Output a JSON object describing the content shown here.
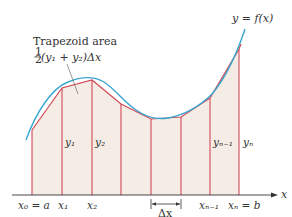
{
  "diagram": {
    "colors": {
      "curve": "#3aa6d0",
      "trapezoid_edges": "#d04a55",
      "fill": "#f6ece6",
      "axis": "#333333",
      "text": "#333333"
    },
    "curve_label": "y = f(x)",
    "annotation": {
      "line1": "Trapezoid area",
      "fraction_num": "1",
      "fraction_den": "2",
      "formula": "(y₁ + y₂)Δx"
    },
    "axis_label": "x",
    "x_labels": [
      {
        "id": "x0",
        "text": "x₀ = a"
      },
      {
        "id": "x1",
        "text": "x₁"
      },
      {
        "id": "x2",
        "text": "x₂"
      },
      {
        "id": "xn-1",
        "text": "xₙ₋₁"
      },
      {
        "id": "xn",
        "text": "xₙ = b"
      }
    ],
    "y_labels": [
      {
        "id": "y1",
        "text": "y₁"
      },
      {
        "id": "y2",
        "text": "y₂"
      },
      {
        "id": "yn-1",
        "text": "yₙ₋₁"
      },
      {
        "id": "yn",
        "text": "yₙ"
      }
    ],
    "delta_label": "Δx",
    "partition_points": [
      {
        "x": 32,
        "y": 130
      },
      {
        "x": 62,
        "y": 88
      },
      {
        "x": 92,
        "y": 80
      },
      {
        "x": 121,
        "y": 104
      },
      {
        "x": 151,
        "y": 119
      },
      {
        "x": 181,
        "y": 117
      },
      {
        "x": 210,
        "y": 98
      },
      {
        "x": 239,
        "y": 49
      }
    ]
  }
}
